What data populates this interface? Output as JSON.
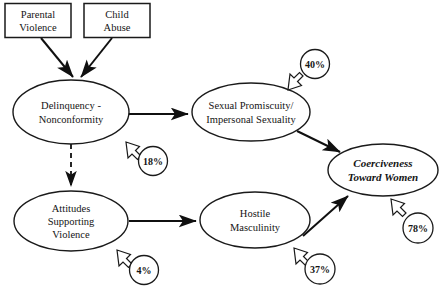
{
  "diagram": {
    "colors": {
      "stroke": "#1a1a1a",
      "text": "#141414",
      "background": "#ffffff"
    },
    "boxes": [
      {
        "id": "parental-violence",
        "line1": "Parental",
        "line2": "Violence"
      },
      {
        "id": "child-abuse",
        "line1": "Child",
        "line2": "Abuse"
      }
    ],
    "ellipses": [
      {
        "id": "delinquency",
        "line1": "Delinquency -",
        "line2": "Nonconformity",
        "line3": "",
        "style": "regular"
      },
      {
        "id": "sexual-promiscuity",
        "line1": "Sexual Promiscuity/",
        "line2": "Impersonal Sexuality",
        "line3": "",
        "style": "regular"
      },
      {
        "id": "attitudes-supporting-violence",
        "line1": "Attitudes",
        "line2": "Supporting",
        "line3": "Violence",
        "style": "regular"
      },
      {
        "id": "hostile-masculinity",
        "line1": "Hostile",
        "line2": "Masculinity",
        "line3": "",
        "style": "regular"
      },
      {
        "id": "coerciveness-toward-women",
        "line1": "Coerciveness",
        "line2": "Toward Women",
        "line3": "",
        "style": "bold-italic"
      }
    ],
    "percent_badges": [
      {
        "id": "pct-delinquency",
        "value": "18%",
        "target": "delinquency"
      },
      {
        "id": "pct-sexual-promiscuity",
        "value": "40%",
        "target": "sexual-promiscuity"
      },
      {
        "id": "pct-attitudes",
        "value": "4%",
        "target": "attitudes-supporting-violence"
      },
      {
        "id": "pct-hostile-masculinity",
        "value": "37%",
        "target": "hostile-masculinity"
      },
      {
        "id": "pct-coerciveness",
        "value": "78%",
        "target": "coerciveness-toward-women"
      }
    ],
    "links": [
      {
        "id": "parental-violence-to-delinquency",
        "from": "parental-violence",
        "to": "delinquency",
        "style": "solid"
      },
      {
        "id": "child-abuse-to-delinquency",
        "from": "child-abuse",
        "to": "delinquency",
        "style": "solid"
      },
      {
        "id": "delinquency-to-sexual-promiscuity",
        "from": "delinquency",
        "to": "sexual-promiscuity",
        "style": "solid"
      },
      {
        "id": "delinquency-to-attitudes",
        "from": "delinquency",
        "to": "attitudes-supporting-violence",
        "style": "dashed"
      },
      {
        "id": "attitudes-to-hostile-masculinity",
        "from": "attitudes-supporting-violence",
        "to": "hostile-masculinity",
        "style": "solid"
      },
      {
        "id": "sexual-promiscuity-to-coerciveness",
        "from": "sexual-promiscuity",
        "to": "coerciveness-toward-women",
        "style": "solid"
      },
      {
        "id": "hostile-masculinity-to-coerciveness",
        "from": "hostile-masculinity",
        "to": "coerciveness-toward-women",
        "style": "solid"
      }
    ]
  }
}
